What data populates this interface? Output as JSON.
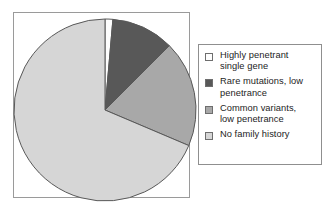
{
  "chart_data": {
    "type": "pie",
    "title": "",
    "subtitle": "",
    "xlabel": "",
    "ylabel": "",
    "grid": false,
    "legend_position": "right",
    "start_angle_deg": 0,
    "direction": "clockwise",
    "categories": [
      "Highly penetrant single gene",
      "Rare mutations, low penetrance",
      "Common variants, low penetrance",
      "No family history"
    ],
    "values": [
      1.5,
      11,
      19,
      68.5
    ],
    "value_unit": "percent",
    "slice_angles_deg": [
      5,
      40,
      68,
      247
    ],
    "colors": [
      "#fdfdfd",
      "#585858",
      "#a8a8a8",
      "#d6d6d6"
    ],
    "slices": [
      {
        "label": "Highly penetrant single gene",
        "value": 1.5,
        "angle_deg": 5,
        "color": "#fdfdfd"
      },
      {
        "label": "Rare mutations, low penetrance",
        "value": 11,
        "angle_deg": 40,
        "color": "#585858"
      },
      {
        "label": "Common variants, low penetrance",
        "value": 19,
        "angle_deg": 68,
        "color": "#a8a8a8"
      },
      {
        "label": "No family history",
        "value": 68.5,
        "angle_deg": 247,
        "color": "#d6d6d6"
      }
    ]
  },
  "legend": {
    "items": [
      {
        "label": "Highly penetrant\nsingle gene",
        "color": "#fdfdfd"
      },
      {
        "label": "Rare mutations, low\npenetrance",
        "color": "#585858"
      },
      {
        "label": "Common variants,\nlow penetrance",
        "color": "#a8a8a8"
      },
      {
        "label": "No family history",
        "color": "#d6d6d6"
      }
    ]
  },
  "style": {
    "plot_border": "#9a9a9a",
    "legend_border": "#8f8f8f",
    "slice_outline": "#585858",
    "background": "#ffffff",
    "text_color": "#1d1d1d"
  }
}
